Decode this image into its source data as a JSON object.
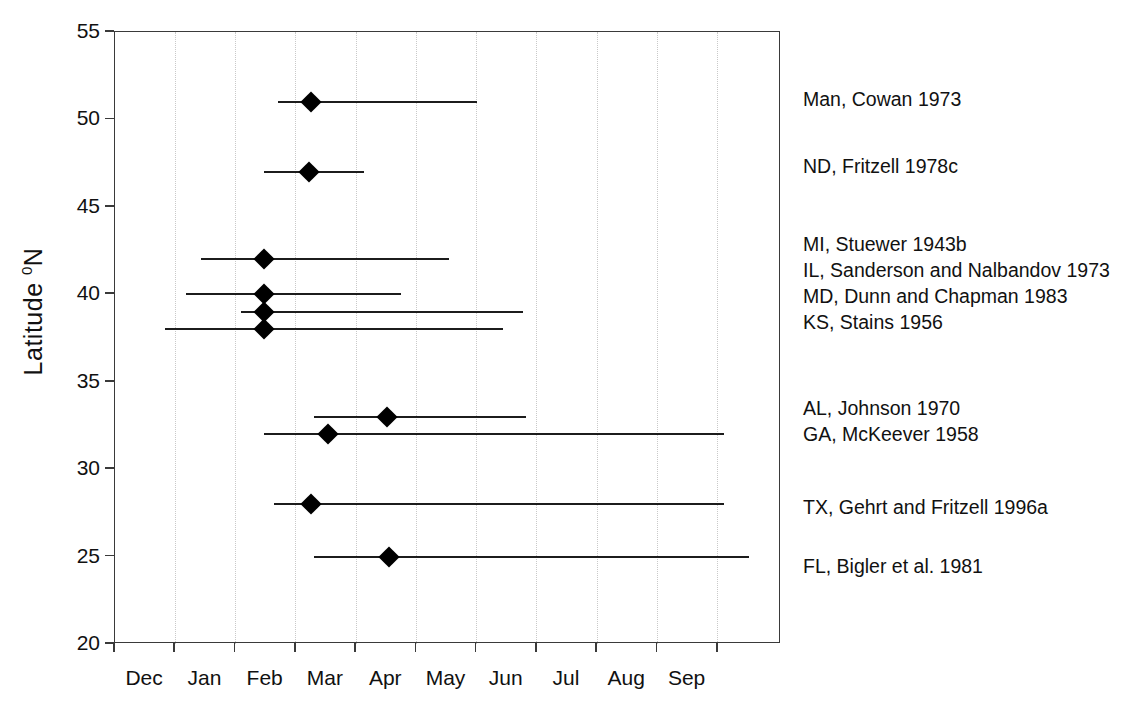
{
  "chart_data": {
    "type": "scatter",
    "title": "",
    "subtitle": "",
    "xlabel": "",
    "ylabel": "Latitude ⁰N",
    "ylabel_text": "Latitude",
    "ylabel_superscript": "0",
    "ylabel_suffix": "N",
    "ylim": [
      20,
      55
    ],
    "yticks": [
      20,
      25,
      30,
      35,
      40,
      45,
      50,
      55
    ],
    "ytick_labels": [
      "20",
      "25",
      "30",
      "35",
      "40",
      "45",
      "50",
      "55"
    ],
    "xtick_labels": [
      "Dec",
      "Jan",
      "Feb",
      "Mar",
      "Apr",
      "May",
      "Jun",
      "Jul",
      "Aug",
      "Sep"
    ],
    "x_axis_units": "month",
    "x_month_boundaries": [
      "Dec",
      "Jan",
      "Feb",
      "Mar",
      "Apr",
      "May",
      "Jun",
      "Jul",
      "Aug",
      "Sep",
      "Oct"
    ],
    "grid": "dotted vertical gridlines at month boundaries",
    "legend_position": "right-of-plot annotations aligned to each series row",
    "marker_style": "filled black diamond",
    "range_style": "horizontal black line (breeding season span)",
    "series": [
      {
        "name": "Man, Cowan 1973",
        "latitude": 51,
        "point_month": 3.25,
        "range_start_month": 2.7,
        "range_end_month": 6.0,
        "range_label": "late Feb – early Jul",
        "point_label": "early Mar"
      },
      {
        "name": "ND, Fritzell 1978c",
        "latitude": 47,
        "point_month": 3.22,
        "range_start_month": 2.48,
        "range_end_month": 4.13,
        "range_label": "mid Feb – early Apr",
        "point_label": "early Mar"
      },
      {
        "name": "MI, Stuewer 1943b",
        "latitude": 42,
        "point_month": 2.47,
        "range_start_month": 1.42,
        "range_end_month": 5.54,
        "range_label": "mid Jan – mid Jun",
        "point_label": "mid Feb"
      },
      {
        "name": "IL, Sanderson and Nalbandov 1973",
        "latitude": 40,
        "point_month": 2.47,
        "range_start_month": 1.18,
        "range_end_month": 4.74,
        "range_label": "early Jan – late May",
        "point_label": "mid Feb"
      },
      {
        "name": "MD, Dunn and Chapman 1983",
        "latitude": 39,
        "point_month": 2.47,
        "range_start_month": 2.09,
        "range_end_month": 6.77,
        "range_label": "early Feb – early Aug",
        "point_label": "mid Feb"
      },
      {
        "name": "KS, Stains 1956",
        "latitude": 38,
        "point_month": 2.47,
        "range_start_month": 0.83,
        "range_end_month": 6.44,
        "range_label": "late Dec – mid Jul",
        "point_label": "mid Feb"
      },
      {
        "name": "AL, Johnson 1970",
        "latitude": 33,
        "point_month": 4.52,
        "range_start_month": 3.31,
        "range_end_month": 6.82,
        "range_label": "mid Mar – early Aug",
        "point_label": "mid Apr"
      },
      {
        "name": "GA, McKeever 1958",
        "latitude": 32,
        "point_month": 3.53,
        "range_start_month": 2.47,
        "range_end_month": 10.11,
        "range_label": "mid Feb – late Sep",
        "point_label": "mid Mar"
      },
      {
        "name": "TX, Gehrt and Fritzell 1996a",
        "latitude": 28,
        "point_month": 3.26,
        "range_start_month": 2.64,
        "range_end_month": 10.11,
        "range_label": "late Feb – late Sep",
        "point_label": "early Mar"
      },
      {
        "name": "FL, Bigler et al. 1981",
        "latitude": 25,
        "point_month": 4.55,
        "range_start_month": 3.31,
        "range_end_month": 10.52,
        "range_label": "mid Mar – mid Oct",
        "point_label": "mid Apr"
      }
    ],
    "annotation_groups": [
      {
        "labels": [
          "Man, Cowan 1973"
        ]
      },
      {
        "labels": [
          "ND, Fritzell 1978c"
        ]
      },
      {
        "labels": [
          "MI, Stuewer 1943b",
          "IL, Sanderson and Nalbandov 1973",
          "MD, Dunn and Chapman 1983",
          "KS, Stains 1956"
        ]
      },
      {
        "labels": [
          "AL, Johnson 1970",
          "GA, McKeever 1958"
        ]
      },
      {
        "labels": [
          "TX, Gehrt and Fritzell 1996a"
        ]
      },
      {
        "labels": [
          "FL, Bigler et al. 1981"
        ]
      }
    ],
    "annotations": [
      {
        "text": "Man, Cowan 1973",
        "y_px": 90
      },
      {
        "text": "ND, Fritzell 1978c",
        "y_px": 157
      },
      {
        "text": "MI, Stuewer 1943b",
        "y_px": 235
      },
      {
        "text": "IL, Sanderson and Nalbandov 1973",
        "y_px": 261
      },
      {
        "text": "MD, Dunn and Chapman 1983",
        "y_px": 287
      },
      {
        "text": "KS, Stains 1956",
        "y_px": 313
      },
      {
        "text": "AL, Johnson 1970",
        "y_px": 399
      },
      {
        "text": "GA, McKeever 1958",
        "y_px": 425
      },
      {
        "text": "TX, Gehrt and Fritzell 1996a",
        "y_px": 498
      },
      {
        "text": "FL, Bigler et al. 1981",
        "y_px": 557
      }
    ],
    "colors": {
      "marker": "#000000",
      "line": "#1c1c1c",
      "axis": "#3a3a3a",
      "grid": "#c9c9c9",
      "text": "#111111",
      "background": "#ffffff"
    }
  }
}
